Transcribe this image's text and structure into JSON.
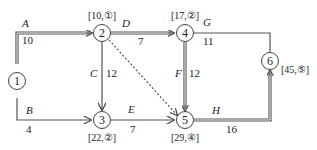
{
  "diagram": {
    "type": "activity-on-arrow network (critical path)",
    "nodes": [
      {
        "id": "1",
        "label": "1",
        "annotation": ""
      },
      {
        "id": "2",
        "label": "2",
        "annotation": "[10,①]"
      },
      {
        "id": "3",
        "label": "3",
        "annotation": "[22,②]"
      },
      {
        "id": "4",
        "label": "4",
        "annotation": "[17,②]"
      },
      {
        "id": "5",
        "label": "5",
        "annotation": "[29,④]"
      },
      {
        "id": "6",
        "label": "6",
        "annotation": "[45,⑤]"
      }
    ],
    "edges": [
      {
        "name": "A",
        "from": "1",
        "to": "2",
        "duration": "10",
        "critical": true
      },
      {
        "name": "B",
        "from": "1",
        "to": "3",
        "duration": "4",
        "critical": false
      },
      {
        "name": "C",
        "from": "2",
        "to": "3",
        "duration": "12",
        "critical": false
      },
      {
        "name": "D",
        "from": "2",
        "to": "4",
        "duration": "7",
        "critical": true
      },
      {
        "name": "",
        "from": "2",
        "to": "5",
        "duration": "",
        "critical": false,
        "dummy": true
      },
      {
        "name": "E",
        "from": "3",
        "to": "5",
        "duration": "7",
        "critical": false
      },
      {
        "name": "F",
        "from": "4",
        "to": "5",
        "duration": "12",
        "critical": true
      },
      {
        "name": "G",
        "from": "4",
        "to": "6",
        "duration": "11",
        "critical": false
      },
      {
        "name": "H",
        "from": "5",
        "to": "6",
        "duration": "16",
        "critical": true
      }
    ],
    "colors": {
      "line": "#555555",
      "text": "#222222",
      "background": "#ffffff"
    }
  }
}
